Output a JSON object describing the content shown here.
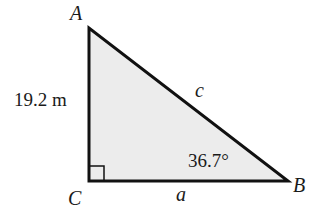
{
  "diagram": {
    "type": "right-triangle",
    "vertices": {
      "A": {
        "label": "A"
      },
      "B": {
        "label": "B"
      },
      "C": {
        "label": "C"
      }
    },
    "sides": {
      "AC": {
        "label": "19.2 m"
      },
      "CB": {
        "label": "a"
      },
      "AB": {
        "label": "c"
      }
    },
    "angle_B": {
      "label": "36.7°"
    },
    "right_angle_at": "C",
    "colors": {
      "fill": "#ececec",
      "stroke": "#111111"
    }
  }
}
